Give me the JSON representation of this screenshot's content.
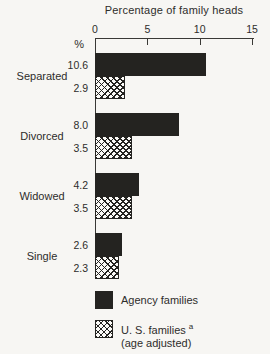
{
  "chart_data": {
    "type": "bar",
    "orientation": "horizontal",
    "title": "Percentage of family heads",
    "categories": [
      "Separated",
      "Divorced",
      "Widowed",
      "Single"
    ],
    "series": [
      {
        "name": "Agency families",
        "style": "solid-black",
        "values": [
          10.6,
          8.0,
          4.2,
          2.6
        ],
        "value_labels": [
          "10.6",
          "8.0",
          "4.2",
          "2.6"
        ]
      },
      {
        "name": "U. S. families (age adjusted)",
        "style": "crosshatch",
        "values": [
          2.9,
          3.5,
          3.5,
          2.3
        ],
        "value_labels": [
          "2.9",
          "3.5",
          "3.5",
          "2.3"
        ]
      }
    ],
    "xlabel": "Percentage of family heads",
    "xlim": [
      0,
      15
    ],
    "xticks": [
      0,
      5,
      10,
      15
    ],
    "xtick_labels": [
      "0",
      "5",
      "10",
      "15"
    ],
    "grid": false,
    "value_labels_shown": true,
    "legend_position": "bottom-left"
  },
  "axis": {
    "unit_label": "%"
  },
  "legend": {
    "agency": {
      "label": "Agency families"
    },
    "us": {
      "label": "U. S. families",
      "superscript": "a",
      "sub_label": "(age adjusted)"
    }
  },
  "colors": {
    "bar_fill": "#242320",
    "background": "#f7f6f3",
    "text": "#2e2d2b",
    "axis_line": "#3a3936"
  }
}
